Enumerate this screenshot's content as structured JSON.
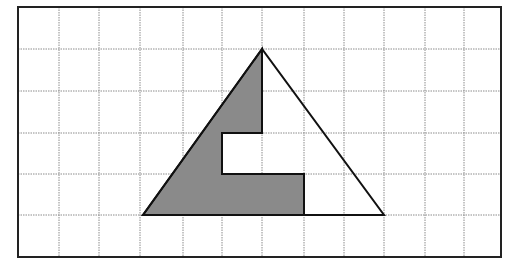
{
  "figure": {
    "grid": {
      "columns": 12,
      "rows": 6,
      "x_lines": [
        18,
        59,
        99,
        140,
        183,
        222,
        262,
        304,
        344,
        384,
        425,
        464,
        501
      ],
      "y_lines": [
        7,
        49,
        91,
        133,
        174,
        215,
        257
      ],
      "line_color": "#8c8c8c",
      "frame_color": "#222222"
    },
    "triangle": {
      "vertices_grid": [
        [
          6,
          1
        ],
        [
          3,
          5
        ],
        [
          9,
          5
        ]
      ],
      "points": "262,49 143,215 384,215",
      "stroke_color": "#111111"
    },
    "shaded_region": {
      "vertices_grid": [
        [
          6,
          1
        ],
        [
          6,
          3
        ],
        [
          5,
          3
        ],
        [
          5,
          4
        ],
        [
          7,
          4
        ],
        [
          7,
          5
        ],
        [
          3,
          5
        ]
      ],
      "points": "262,49 262,133 222,133 222,174 304,174 304,215 143,215",
      "fill_color": "#8a8a8a"
    }
  }
}
